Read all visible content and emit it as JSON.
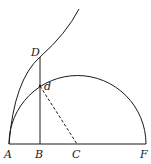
{
  "diagram": {
    "labels": {
      "A": "A",
      "B": "B",
      "C": "C",
      "F": "F",
      "D": "D",
      "d": "d"
    },
    "elements": [
      "baseline AF",
      "semicircle centered at C with diameter AF",
      "curve from A through D",
      "vertical segment BD",
      "dashed segment dC"
    ],
    "stroke_color": "#1a1a1a",
    "background": "#ffffff"
  }
}
